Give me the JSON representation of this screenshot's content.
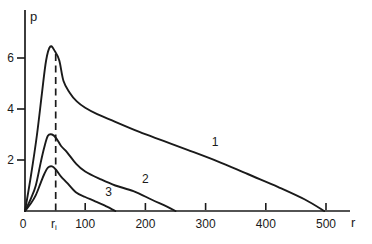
{
  "figure": {
    "background": "#ffffff",
    "ink_color": "#1a1a1a"
  },
  "chart_data": {
    "type": "line",
    "title": "",
    "xlabel": "r",
    "ylabel": "p",
    "xlim": [
      0,
      540
    ],
    "ylim": [
      0,
      7.9
    ],
    "grid": false,
    "x_ticks": [
      100,
      200,
      300,
      400,
      500
    ],
    "y_ticks": [
      2,
      4,
      6
    ],
    "origin_label": "0",
    "guide": {
      "label_base": "r",
      "label_sub": "i",
      "x": 51,
      "top": 6.3,
      "style": "dashed"
    },
    "series": [
      {
        "name": "curve-1",
        "label": "1",
        "label_pos": [
          316,
          2.55
        ],
        "points": [
          [
            0,
            0
          ],
          [
            10,
            1.4
          ],
          [
            20,
            3.0
          ],
          [
            28,
            4.6
          ],
          [
            35,
            5.9
          ],
          [
            42,
            6.45
          ],
          [
            50,
            6.25
          ],
          [
            57,
            5.9
          ],
          [
            64,
            5.1
          ],
          [
            74,
            4.65
          ],
          [
            86,
            4.3
          ],
          [
            100,
            4.05
          ],
          [
            120,
            3.8
          ],
          [
            150,
            3.5
          ],
          [
            190,
            3.1
          ],
          [
            230,
            2.75
          ],
          [
            270,
            2.4
          ],
          [
            320,
            1.95
          ],
          [
            370,
            1.45
          ],
          [
            420,
            0.95
          ],
          [
            465,
            0.45
          ],
          [
            497,
            0
          ]
        ]
      },
      {
        "name": "curve-2",
        "label": "2",
        "label_pos": [
          200,
          1.1
        ],
        "points": [
          [
            0,
            0
          ],
          [
            10,
            0.5
          ],
          [
            18,
            1.0
          ],
          [
            26,
            1.9
          ],
          [
            32,
            2.5
          ],
          [
            38,
            2.95
          ],
          [
            45,
            3.0
          ],
          [
            52,
            2.85
          ],
          [
            60,
            2.55
          ],
          [
            70,
            2.3
          ],
          [
            85,
            1.85
          ],
          [
            100,
            1.55
          ],
          [
            125,
            1.25
          ],
          [
            150,
            1.0
          ],
          [
            180,
            0.78
          ],
          [
            210,
            0.45
          ],
          [
            235,
            0.18
          ],
          [
            250,
            0
          ]
        ]
      },
      {
        "name": "curve-3",
        "label": "3",
        "label_pos": [
          139,
          0.58
        ],
        "points": [
          [
            0,
            0
          ],
          [
            10,
            0.3
          ],
          [
            18,
            0.62
          ],
          [
            26,
            1.1
          ],
          [
            32,
            1.45
          ],
          [
            38,
            1.7
          ],
          [
            45,
            1.75
          ],
          [
            52,
            1.6
          ],
          [
            60,
            1.35
          ],
          [
            70,
            1.1
          ],
          [
            85,
            0.72
          ],
          [
            100,
            0.55
          ],
          [
            115,
            0.4
          ],
          [
            132,
            0.22
          ],
          [
            150,
            0
          ]
        ]
      }
    ]
  }
}
